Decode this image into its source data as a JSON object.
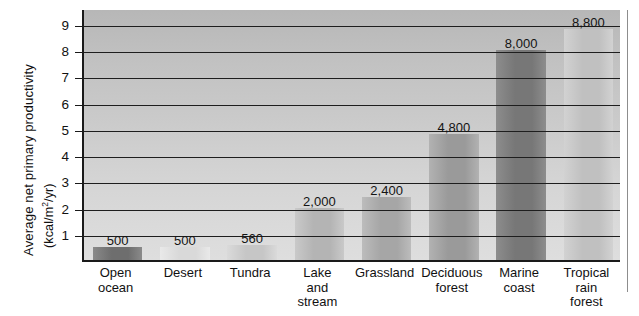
{
  "chart_data": {
    "type": "bar",
    "title": "",
    "subtitle": "",
    "xlabel": "",
    "ylabel": "Average net primary productivity (kcal/m²/yr)",
    "ylabel_line1": "Average net primary productivity",
    "ylabel_line2_pre": "(kcal/m",
    "ylabel_line2_sup": "2",
    "ylabel_line2_post": "/yr)",
    "y_unit_scale": 1000,
    "y_unit_note": "axis ticks are in thousands of kcal/m2/yr",
    "ylim": [
      0,
      9.6
    ],
    "ytick_labels": [
      "1",
      "2",
      "3",
      "4",
      "5",
      "6",
      "7",
      "8",
      "9"
    ],
    "ytick_values": [
      1,
      2,
      3,
      4,
      5,
      6,
      7,
      8,
      9
    ],
    "grid": true,
    "grid_axis": "y",
    "legend": false,
    "legend_position": "none",
    "categories": [
      "Open ocean",
      "Desert",
      "Tundra",
      "Lake and stream",
      "Grassland",
      "Deciduous forest",
      "Marine coast",
      "Tropical rain forest"
    ],
    "category_label_lines": [
      [
        "Open",
        "ocean"
      ],
      [
        "Desert"
      ],
      [
        "Tundra"
      ],
      [
        "Lake",
        "and",
        "stream"
      ],
      [
        "Grassland"
      ],
      [
        "Deciduous",
        "forest"
      ],
      [
        "Marine",
        "coast"
      ],
      [
        "Tropical",
        "rain",
        "forest"
      ]
    ],
    "values": [
      500,
      500,
      560,
      2000,
      2400,
      4800,
      8000,
      8800
    ],
    "value_labels": [
      "500",
      "500",
      "560",
      "2,000",
      "2,400",
      "4,800",
      "8,000",
      "8,800"
    ],
    "bar_colors": [
      "#6e6e6e",
      "#d9d9d9",
      "#c6c6c6",
      "#b4b4b4",
      "#a6a6a6",
      "#9a9a9a",
      "#777777",
      "#c0c0c0"
    ],
    "bar_colors_light": [
      "#8a8a8a",
      "#e9e9e9",
      "#dadada",
      "#c9c9c9",
      "#bcbcbc",
      "#b2b2b2",
      "#8d8d8d",
      "#d2d2d2"
    ],
    "plot_background_top": "#b7b7b7",
    "plot_background_bottom": "#dedede",
    "axis_color": "#1a1a1a",
    "grid_color": "#1e1e1e",
    "text_color": "#111111"
  }
}
